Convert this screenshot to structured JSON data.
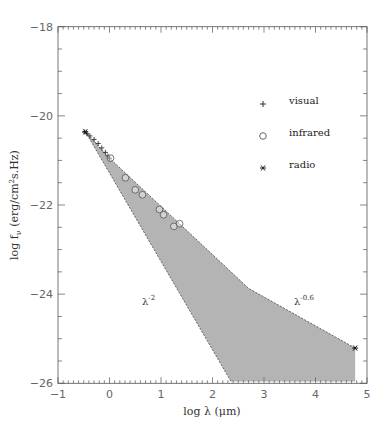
{
  "chart_data": {
    "type": "scatter",
    "title": "",
    "xlabel": "log λ (μm)",
    "ylabel": "log f_ν (erg/cm²s.Hz)",
    "xlim": [
      -1,
      5
    ],
    "ylim": [
      -26,
      -18
    ],
    "xticks": [
      -1,
      0,
      1,
      2,
      3,
      4,
      5
    ],
    "xtick_labels": [
      "-1",
      "0",
      "1",
      "2",
      "3",
      "4",
      "5"
    ],
    "yticks": [
      -18,
      -20,
      -22,
      -24,
      -26
    ],
    "ytick_labels": [
      "-18",
      "-20",
      "-22",
      "-24",
      "-26"
    ],
    "grid": false,
    "legend_position": "upper right",
    "series": [
      {
        "name": "visual",
        "marker": "plus",
        "points": [
          [
            -0.48,
            -20.36
          ],
          [
            -0.44,
            -20.4
          ],
          [
            -0.38,
            -20.45
          ],
          [
            -0.3,
            -20.53
          ],
          [
            -0.22,
            -20.62
          ],
          [
            -0.15,
            -20.72
          ],
          [
            -0.08,
            -20.82
          ],
          [
            -0.03,
            -20.9
          ],
          [
            0.0,
            -20.95
          ]
        ]
      },
      {
        "name": "infrared",
        "marker": "circle",
        "points": [
          [
            0.02,
            -20.95
          ],
          [
            0.31,
            -21.39
          ],
          [
            0.5,
            -21.66
          ],
          [
            0.64,
            -21.77
          ],
          [
            0.97,
            -22.1
          ],
          [
            1.05,
            -22.22
          ],
          [
            1.25,
            -22.48
          ],
          [
            1.36,
            -22.42
          ]
        ]
      },
      {
        "name": "radio",
        "marker": "asterisk",
        "points": [
          [
            -0.47,
            -20.36
          ],
          [
            4.77,
            -25.21
          ]
        ]
      }
    ],
    "shaded_region": {
      "fill": "#b4b4b4",
      "polygon": [
        [
          -0.47,
          -20.35
        ],
        [
          0.0,
          -20.95
        ],
        [
          1.36,
          -22.42
        ],
        [
          2.7,
          -23.87
        ],
        [
          4.77,
          -25.21
        ],
        [
          4.77,
          -25.96
        ],
        [
          2.36,
          -25.96
        ]
      ],
      "upper_dashed": [
        [
          -0.47,
          -20.35
        ],
        [
          0.0,
          -20.95
        ],
        [
          1.36,
          -22.42
        ],
        [
          2.7,
          -23.87
        ],
        [
          4.77,
          -25.21
        ]
      ],
      "lower_dashed": [
        [
          -0.47,
          -20.35
        ],
        [
          2.36,
          -25.96
        ]
      ]
    },
    "annotations": [
      {
        "text": "λ",
        "sup": "-2",
        "x": 0.7,
        "y": -24.1
      },
      {
        "text": "λ",
        "sup": "-0.6",
        "x": 3.6,
        "y": -24.1
      }
    ]
  },
  "legend": {
    "items": [
      {
        "label": "visual",
        "symbol": "+"
      },
      {
        "label": "infrared",
        "symbol": "○"
      },
      {
        "label": "radio",
        "symbol": "✱"
      }
    ]
  },
  "labels": {
    "xlabel": "log λ (μm)",
    "ylabel_main": "log f",
    "ylabel_sub": "ν",
    "ylabel_rest": " (erg/cm",
    "ylabel_sup": "2",
    "ylabel_end": "s.Hz)",
    "annot1_base": "λ",
    "annot1_sup": "-2",
    "annot2_base": "λ",
    "annot2_sup": "-0.6"
  },
  "colors": {
    "fill": "#b4b4b4",
    "axis": "#555555",
    "marker": "#444444"
  }
}
